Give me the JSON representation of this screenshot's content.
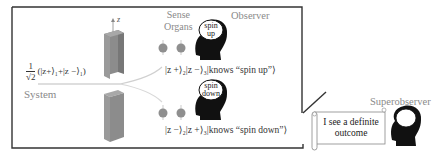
{
  "diagram": {
    "axis_label": "z",
    "system": {
      "label": "System",
      "state_prefix": "1",
      "state_sqrt": "√2",
      "state_body": "(|z+⟩₁+|z −⟩₁)"
    },
    "sense_organs": {
      "label_line1": "Sense",
      "label_line2": "Organs"
    },
    "observer": {
      "label": "Observer",
      "up_thought_line1": "spin",
      "up_thought_line2": "up",
      "down_thought_line1": "spin",
      "down_thought_line2": "down"
    },
    "branches": [
      {
        "state": "|z +⟩₂|z −⟩₃|knows “spin up”⟩"
      },
      {
        "state": "|z −⟩₂|z +⟩₃|knows “spin down”⟩"
      }
    ],
    "superobserver": {
      "label": "Superobserver",
      "scroll_line1": "I see a definite",
      "scroll_line2": "outcome"
    },
    "colors": {
      "frame": "#333333",
      "magnet": "#8c8c8c",
      "magnet_top": "#a8a8a8",
      "sense_organ": "#8f8f8f",
      "head": "#111111",
      "label_gray": "#8a8a8a",
      "beam": "#cfcfcf"
    }
  }
}
